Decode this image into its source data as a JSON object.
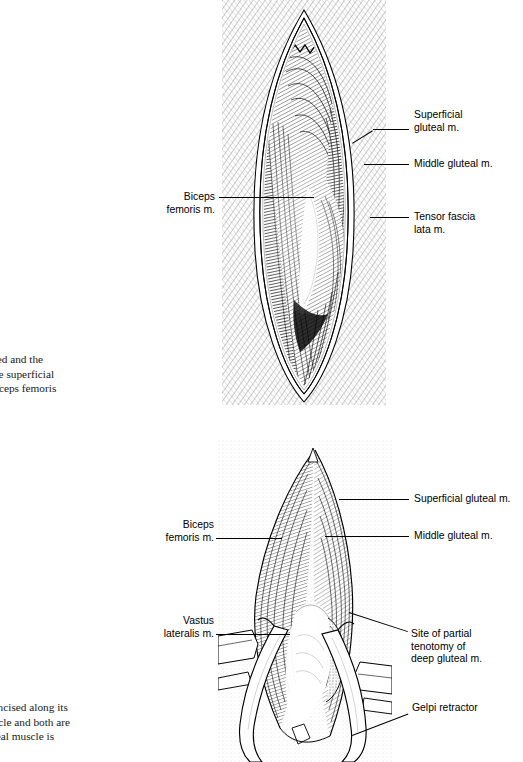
{
  "page": {
    "kind": "surgical-atlas-plate",
    "background_color": "#ffffff",
    "ink_color": "#000000"
  },
  "figures": [
    {
      "id": "figure-top",
      "description": "Craniolateral approach to the hip: skin and subcutaneous tissue retracted, lens-shaped incision exposing superficial gluteal, middle gluteal, tensor fascia lata and biceps femoris muscles",
      "style": "stipple-and-hatch pen and ink, dense dark shading"
    },
    {
      "id": "figure-bottom",
      "description": "Fascia lata incised along its border; muscles retracted with Gelpi retractor, partial tenotomy site of deep gluteal muscle exposed",
      "style": "line and stipple pen and ink, lighter shading"
    }
  ],
  "labels_top": [
    {
      "name": "superficial-gluteal",
      "lines": [
        "Superficial",
        "gluteal m."
      ],
      "side": "right"
    },
    {
      "name": "middle-gluteal",
      "lines": [
        "Middle gluteal m."
      ],
      "side": "right"
    },
    {
      "name": "tensor-fascia-lata",
      "lines": [
        "Tensor fascia",
        "lata m."
      ],
      "side": "right"
    },
    {
      "name": "biceps-femoris",
      "lines": [
        "Biceps",
        "femoris m."
      ],
      "side": "left"
    }
  ],
  "labels_bottom": [
    {
      "name": "superficial-gluteal",
      "lines": [
        "Superficial gluteal m."
      ],
      "side": "right"
    },
    {
      "name": "middle-gluteal",
      "lines": [
        "Middle gluteal m."
      ],
      "side": "right"
    },
    {
      "name": "site-of-partial-tenotomy",
      "lines": [
        "Site of partial",
        "tenotomy of",
        "deep gluteal m."
      ],
      "side": "right"
    },
    {
      "name": "gelpi-retractor",
      "lines": [
        "Gelpi retractor"
      ],
      "side": "right"
    },
    {
      "name": "biceps-femoris",
      "lines": [
        "Biceps",
        "femoris m."
      ],
      "side": "left"
    },
    {
      "name": "vastus-lateralis",
      "lines": [
        "Vastus",
        "lateralis m."
      ],
      "side": "left"
    }
  ],
  "captions": {
    "top": {
      "clipped_left": true,
      "lines": [
        "s are retracted and the",
        "to expose the superficial",
        "a lata and biceps femoris"
      ]
    },
    "bottom": {
      "clipped_left": true,
      "lines": [
        "ia lata is incised along its",
        "noris muscle and both are",
        " deep gluteal muscle is"
      ]
    }
  }
}
